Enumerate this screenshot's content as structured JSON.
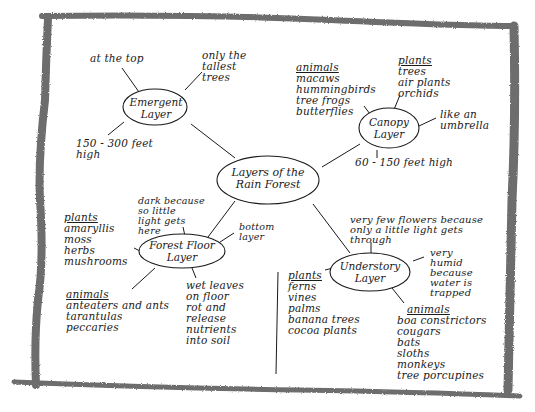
{
  "diagram": {
    "type": "concept-map",
    "central": {
      "label_line1": "Layers of the",
      "label_line2": "Rain Forest"
    },
    "nodes": {
      "emergent": {
        "label_line1": "Emergent",
        "label_line2": "Layer",
        "facts": {
          "top": "at the top",
          "tallest": [
            "only the",
            "tallest",
            "trees"
          ],
          "height": [
            "150 - 300 feet",
            "high"
          ]
        }
      },
      "canopy": {
        "label_line1": "Canopy",
        "label_line2": "Layer",
        "animals": {
          "header": "animals",
          "items": [
            "macaws",
            "hummingbirds",
            "tree frogs",
            "butterflies"
          ]
        },
        "plants": {
          "header": "plants",
          "items": [
            "trees",
            "air plants",
            "orchids"
          ]
        },
        "facts": {
          "umbrella": [
            "like an",
            "umbrella"
          ],
          "height": "60 - 150 feet high"
        }
      },
      "forest_floor": {
        "label_line1": "Forest Floor",
        "label_line2": "Layer",
        "plants": {
          "header": "plants",
          "items": [
            "amaryllis",
            "moss",
            "herbs",
            "mushrooms"
          ]
        },
        "animals": {
          "header": "animals",
          "items": [
            "anteaters and ants",
            "tarantulas",
            "peccaries"
          ]
        },
        "facts": {
          "dark": [
            "dark because",
            "so little",
            "light gets",
            "here"
          ],
          "bottom": [
            "bottom",
            "layer"
          ],
          "leaves": [
            "wet leaves",
            "on floor",
            "rot and",
            "release",
            "nutrients",
            "into soil"
          ]
        }
      },
      "understory": {
        "label_line1": "Understory",
        "label_line2": "Layer",
        "plants": {
          "header": "plants",
          "items": [
            "ferns",
            "vines",
            "palms",
            "banana trees",
            "cocoa plants"
          ]
        },
        "animals": {
          "header": "animals",
          "items": [
            "boa constrictors",
            "cougars",
            "bats",
            "sloths",
            "monkeys",
            "tree porcupines"
          ]
        },
        "facts": {
          "flowers": [
            "very few flowers because",
            "only a little light gets",
            "through"
          ],
          "humid": [
            "very",
            "humid",
            "because",
            "water is",
            "trapped"
          ]
        }
      }
    },
    "colors": {
      "ink": "#1a1a1a",
      "frame": "#6b6b6b",
      "paper": "#ffffff"
    }
  }
}
